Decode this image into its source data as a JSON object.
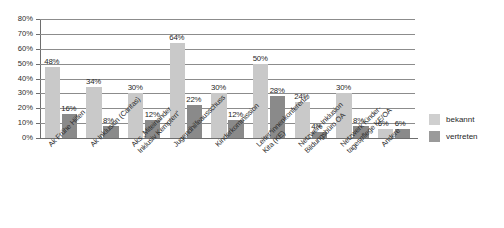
{
  "chart_data": {
    "type": "bar",
    "title": "",
    "subtitle": "",
    "xlabel": "",
    "ylabel": "",
    "ylim": [
      0,
      80
    ],
    "ytick_labels": [
      "80%",
      "70%",
      "60%",
      "50%",
      "40%",
      "30%",
      "20%",
      "10%",
      "0%"
    ],
    "ytick_values": [
      80,
      70,
      60,
      50,
      40,
      30,
      20,
      10,
      0
    ],
    "grid": true,
    "legend_position": "right",
    "categories": [
      "Ak Frühe Hilfen",
      "Ak Inklusion (Caritas)",
      "Aks „Miteinander Inklusiv Kempten“",
      "Jugendhilfeausschuss",
      "Kinderkommission",
      "Leiter*innenkonferenz Kita (KE)",
      "Netzwerk Inklusion Bildungsbüro OA",
      "Netzwerk Kindertagespflege KE/OA",
      "Andere"
    ],
    "category_lines": [
      [
        "Ak Frühe Hilfen"
      ],
      [
        "Ak Inklusion (Caritas)"
      ],
      [
        "Aks „Miteinander",
        "Inklusiv Kempten“"
      ],
      [
        "Jugendhilfeausschuss"
      ],
      [
        "Kinderkommission"
      ],
      [
        "Leiter*innenkonferenz",
        "Kita (KE)"
      ],
      [
        "Netzwerk Inklusion",
        "Bildungsbüro OA"
      ],
      [
        "Netzwerk Kinder-",
        "tagespflege KE/OA"
      ],
      [
        "Andere"
      ]
    ],
    "series": [
      {
        "name": "bekannt",
        "color": "#c9c9c9",
        "values": [
          48,
          34,
          30,
          64,
          30,
          50,
          24,
          30,
          6
        ],
        "labels": [
          "48%",
          "34%",
          "30%",
          "64%",
          "30%",
          "50%",
          "24%",
          "30%",
          "6%"
        ]
      },
      {
        "name": "vertreten",
        "color": "#8a8a8a",
        "values": [
          16,
          8,
          12,
          22,
          12,
          28,
          4,
          8,
          6
        ],
        "labels": [
          "16%",
          "8%",
          "12%",
          "22%",
          "12%",
          "28%",
          "4%",
          "8%",
          "6%"
        ]
      }
    ]
  },
  "legend": {
    "items": [
      {
        "label": "bekannt",
        "color": "#cfcfcf"
      },
      {
        "label": "vertreten",
        "color": "#9a9a9a"
      }
    ]
  }
}
